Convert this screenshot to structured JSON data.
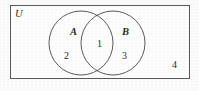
{
  "figure": {
    "type": "venn-diagram",
    "background_color": "#fdfdfd",
    "stroke_color": "#4a4a4a"
  },
  "universe": {
    "label": "U",
    "rect": {
      "x": 10,
      "y": 5,
      "width": 180,
      "height": 74
    }
  },
  "sets": [
    {
      "label": "A",
      "cx": 81,
      "cy": 43,
      "r": 32,
      "label_x": 70,
      "label_y": 27
    },
    {
      "label": "B",
      "cx": 113,
      "cy": 43,
      "r": 32,
      "label_x": 122,
      "label_y": 27
    }
  ],
  "regions": [
    {
      "id": "a-only",
      "label": "2",
      "x": 64,
      "y": 51
    },
    {
      "id": "intersection",
      "label": "1",
      "x": 96,
      "y": 39
    },
    {
      "id": "b-only",
      "label": "3",
      "x": 122,
      "y": 51
    },
    {
      "id": "outside",
      "label": "4",
      "x": 172,
      "y": 60
    }
  ]
}
